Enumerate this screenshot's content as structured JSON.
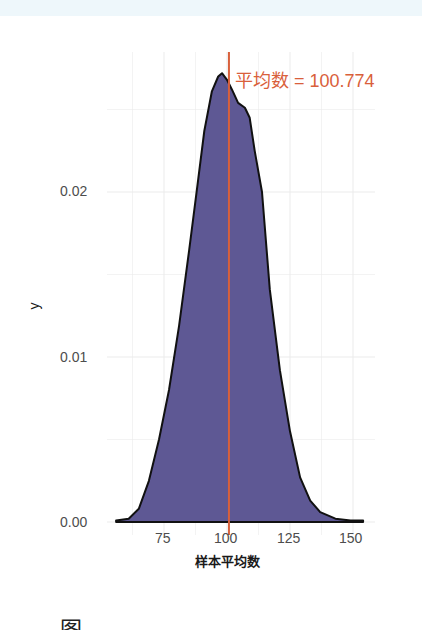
{
  "chart_data": {
    "type": "area",
    "subtype": "density",
    "title": "",
    "xlabel": "样本平均数",
    "ylabel": "y",
    "xlim": [
      55,
      157
    ],
    "ylim": [
      0,
      0.0285
    ],
    "x_ticks": [
      75,
      100,
      125,
      150
    ],
    "x_tick_labels": [
      "75",
      "100",
      "125",
      "150"
    ],
    "y_ticks": [
      0.0,
      0.01,
      0.02
    ],
    "y_tick_labels": [
      "0.00",
      "0.01",
      "0.02"
    ],
    "grid": true,
    "legend": null,
    "series": [
      {
        "name": "density",
        "fill": "#5e5894",
        "stroke": "#111111",
        "x": [
          56,
          61,
          65,
          69,
          73,
          77,
          81,
          85,
          88,
          91,
          94,
          96.5,
          98,
          100,
          102,
          104.4,
          107.1,
          109,
          111,
          113.9,
          117,
          121,
          125,
          129,
          133,
          137,
          143,
          149,
          154
        ],
        "y": [
          0.0001,
          0.0002,
          0.0008,
          0.0025,
          0.005,
          0.008,
          0.0119,
          0.0165,
          0.0201,
          0.0237,
          0.0261,
          0.027,
          0.0272,
          0.0268,
          0.0262,
          0.0254,
          0.0251,
          0.0245,
          0.0225,
          0.02,
          0.0141,
          0.0092,
          0.0055,
          0.0027,
          0.0013,
          0.0006,
          0.0002,
          0.0001,
          0.0001
        ]
      }
    ],
    "annotations": [
      {
        "type": "vline",
        "x": 100.774,
        "color": "#d9603b",
        "label": "平均数 = 100.774"
      }
    ]
  },
  "labels": {
    "annotation": "平均数 = 100.774",
    "xlabel": "样本平均数",
    "ylabel": "y",
    "xticks": [
      "75",
      "100",
      "125",
      "150"
    ],
    "yticks": [
      "0.00",
      "0.01",
      "0.02"
    ]
  },
  "caption": {
    "text": "图"
  },
  "colors": {
    "fill": "#5e5894",
    "outline": "#111111",
    "mean_line": "#d9603b",
    "grid": "#ebebeb",
    "tick_text": "#4d4d4d"
  }
}
